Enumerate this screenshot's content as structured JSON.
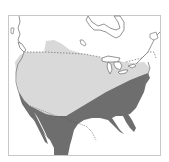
{
  "map": {
    "subject": "North America range map",
    "colors": {
      "background": "#ffffff",
      "frame": "#c8c8c8",
      "land_outline": "#7a7a7a",
      "range_light": "#d9d9d9",
      "range_dark": "#6e6e6e",
      "border_dash": "#777777",
      "water": "#ffffff"
    },
    "regions": [
      {
        "name": "range-light",
        "description": "light gray range, northern/western US and southern Canada"
      },
      {
        "name": "range-dark",
        "description": "dark gray range, southeastern US and Mexico"
      }
    ],
    "features": [
      "coastline",
      "great-lakes",
      "hudson-bay",
      "us-canada-border-dashed",
      "us-mexico-border"
    ]
  }
}
